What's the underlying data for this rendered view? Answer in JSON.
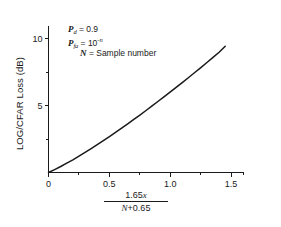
{
  "chart_data": {
    "type": "line",
    "title": "",
    "xlabel": "1.65x / (N+0.65)",
    "ylabel": "LOG/CFAR Loss (dB)",
    "xlim": [
      0,
      1.6
    ],
    "ylim": [
      0,
      11
    ],
    "grid": false,
    "legend": null,
    "x_ticks": [
      {
        "value": 0,
        "label": "0"
      },
      {
        "value": 0.5,
        "label": "0.5"
      },
      {
        "value": 1.0,
        "label": "1.0"
      },
      {
        "value": 1.5,
        "label": "1.5"
      }
    ],
    "x_minor_ticks": [
      0.25,
      0.75,
      1.25
    ],
    "y_ticks": [
      {
        "value": 0,
        "label": ""
      },
      {
        "value": 5,
        "label": "5"
      },
      {
        "value": 10,
        "label": "10"
      }
    ],
    "y_minor_ticks": [
      2.5,
      7.5
    ],
    "series": [
      {
        "name": "LOG/CFAR Loss",
        "color": "#1a1a1a",
        "x": [
          0.0,
          0.05,
          0.1,
          0.15,
          0.2,
          0.25,
          0.3,
          0.35,
          0.4,
          0.45,
          0.5,
          0.55,
          0.6,
          0.65,
          0.7,
          0.75,
          0.8,
          0.85,
          0.9,
          0.95,
          1.0,
          1.05,
          1.1,
          1.15,
          1.2,
          1.25,
          1.3,
          1.35,
          1.4,
          1.45
        ],
        "y": [
          0.0,
          0.22,
          0.45,
          0.7,
          0.95,
          1.22,
          1.5,
          1.79,
          2.08,
          2.38,
          2.69,
          3.0,
          3.32,
          3.64,
          3.97,
          4.3,
          4.64,
          4.98,
          5.33,
          5.68,
          6.03,
          6.39,
          6.75,
          7.11,
          7.48,
          7.85,
          8.23,
          8.61,
          9.0,
          9.45
        ]
      }
    ],
    "annotations": [
      {
        "id": "pd",
        "symbol": "P",
        "subscript": "d",
        "equals": "=",
        "value": "0.9"
      },
      {
        "id": "pfa",
        "symbol": "P",
        "subscript": "fa",
        "equals": "=",
        "value": "10",
        "exponent": "-n"
      },
      {
        "id": "n-def",
        "symbol": "N",
        "equals": "=",
        "value": "Sample number"
      }
    ],
    "xlabel_fraction": {
      "numerator_const": "1.65",
      "numerator_var": "x",
      "denominator_var": "N",
      "denominator_rest": "+0.65"
    }
  },
  "figure": {
    "background_color": "#ffffff",
    "ink_color": "#1a1a1a"
  }
}
